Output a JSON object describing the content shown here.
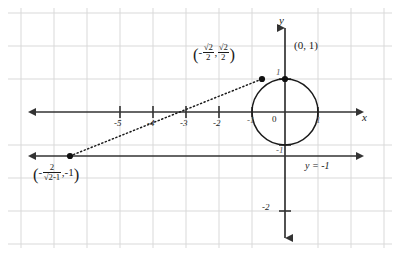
{
  "figure": {
    "background_color": "#ffffff",
    "grid_color": "#d9d9d9",
    "axis_color": "#333333",
    "curve_color": "#1a1a1a"
  },
  "axes": {
    "x_label": "x",
    "y_label": "y",
    "origin_label": "0",
    "x_ticks": [
      {
        "value": -5,
        "label": "-5"
      },
      {
        "value": -4,
        "label": "-4"
      },
      {
        "value": -3,
        "label": "-3"
      },
      {
        "value": -2,
        "label": "-2"
      },
      {
        "value": -1,
        "label": "-1"
      },
      {
        "value": 1,
        "label": "1"
      }
    ],
    "y_ticks": [
      {
        "value": 1,
        "label": "1"
      },
      {
        "value": -1,
        "label": "-1"
      },
      {
        "value": -2,
        "label": "-2"
      }
    ]
  },
  "circle": {
    "center_x": 0,
    "center_y": 0,
    "radius": 1,
    "name": "unit-circle"
  },
  "horizontal_line": {
    "equation_label": "y = -1",
    "y_value": -1
  },
  "points": [
    {
      "name": "top-point",
      "label": "(0, 1)",
      "x": 0,
      "y": 1
    },
    {
      "name": "tangency-point",
      "label_parts": {
        "open": "(",
        "minus": "-",
        "first_numerator": "√2",
        "first_denominator": "2",
        "comma": ",",
        "second_numerator": "√2",
        "second_denominator": "2",
        "close": ")"
      },
      "label_text": "(-√2/2, √2/2)",
      "x": -0.7071,
      "y": 0.7071
    },
    {
      "name": "external-point",
      "label_parts": {
        "open": "(",
        "minus": "-",
        "numerator": "2",
        "denominator": "√2-1",
        "comma": ",",
        "y_value": "-1",
        "close": ")"
      },
      "label_text": "(-2/(√2-1), -1)",
      "x": -4.828,
      "y": -1
    }
  ],
  "dotted_line": {
    "name": "tangent-ray",
    "from": {
      "x": -4.828,
      "y": -1
    },
    "to": {
      "x": -0.7071,
      "y": 0.7071
    },
    "style": "dotted"
  }
}
